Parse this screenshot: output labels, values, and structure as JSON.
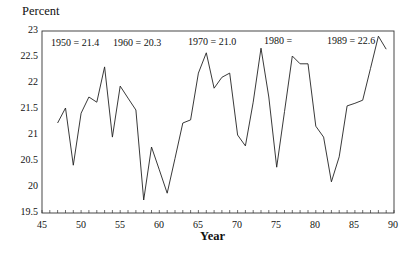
{
  "chart_data": {
    "type": "line",
    "title": "",
    "ylabel": "Percent",
    "xlabel": "Year",
    "xlim": [
      45,
      90
    ],
    "ylim": [
      19.5,
      23
    ],
    "xticks": [
      45,
      50,
      55,
      60,
      65,
      70,
      75,
      80,
      85,
      90
    ],
    "yticks": [
      19.5,
      20,
      20.5,
      21,
      21.5,
      22,
      22.5,
      23
    ],
    "grid": false,
    "legend": null,
    "annotations": [
      {
        "text": "1950 = 21.4",
        "x": 46.2,
        "y": 22.72
      },
      {
        "text": "1960 = 20.3",
        "x": 54.4,
        "y": 22.72
      },
      {
        "text": "1970 = 21.0",
        "x": 64.8,
        "y": 22.72
      },
      {
        "text": "1980 =",
        "x": 73.3,
        "y": 22.75
      },
      {
        "text": "1989 = 22.6",
        "x": 79.6,
        "y": 22.75
      }
    ],
    "series": [
      {
        "name": "Percent",
        "x": [
          47,
          48,
          49,
          50,
          51,
          52,
          53,
          54,
          55,
          56,
          57,
          58,
          59,
          60,
          61,
          62,
          63,
          64,
          65,
          66,
          67,
          68,
          69,
          70,
          71,
          72,
          73,
          74,
          75,
          76,
          77,
          78,
          79,
          80,
          81,
          82,
          83,
          84,
          85,
          86,
          87,
          88,
          89
        ],
        "values": [
          21.23,
          21.52,
          20.42,
          21.42,
          21.73,
          21.63,
          22.31,
          20.96,
          21.94,
          21.71,
          21.48,
          19.75,
          20.77,
          20.33,
          19.88,
          20.55,
          21.23,
          21.29,
          22.19,
          22.58,
          21.9,
          22.11,
          22.19,
          21.0,
          20.79,
          21.63,
          22.67,
          21.73,
          20.38,
          21.45,
          22.52,
          22.37,
          22.37,
          21.17,
          20.96,
          20.1,
          20.58,
          21.56,
          21.61,
          21.67,
          22.28,
          22.9,
          22.65
        ]
      }
    ]
  },
  "labels": {
    "ylabel": "Percent",
    "xlabel": "Year",
    "ann": [
      "1950 = 21.4",
      "1960 = 20.3",
      "1970 = 21.0",
      "1980 =",
      "1989 = 22.6"
    ],
    "yticks": [
      "23",
      "22.5",
      "22",
      "21.5",
      "21",
      "20.5",
      "20",
      "19.5"
    ],
    "xticks": [
      "45",
      "50",
      "55",
      "60",
      "65",
      "70",
      "75",
      "80",
      "85",
      "90"
    ]
  }
}
